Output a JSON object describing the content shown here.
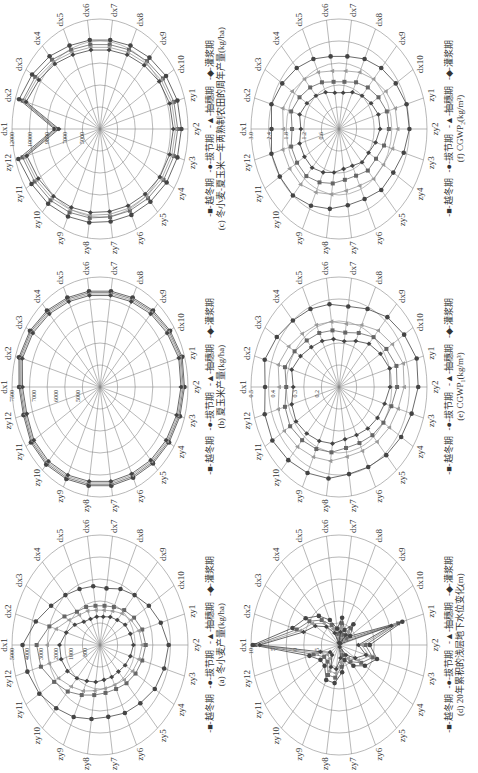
{
  "figure": {
    "axes": [
      "dx1",
      "dx2",
      "dx3",
      "dx4",
      "dx5",
      "dx6",
      "dx7",
      "dx8",
      "dx9",
      "dx10",
      "zy1",
      "zy2",
      "zy3",
      "zy4",
      "zy5",
      "zy6",
      "zy7",
      "zy8",
      "zy9",
      "zy10",
      "zy11",
      "zy12"
    ],
    "legend": [
      {
        "symbol": "■",
        "label": "越冬期"
      },
      {
        "symbol": "●",
        "label": "拔节期"
      },
      {
        "symbol": "▲",
        "label": "抽穗期"
      },
      {
        "symbol": "◆",
        "label": "灌浆期"
      }
    ],
    "colors": {
      "grid": "#888888",
      "series_dark": "#444444",
      "series_mid": "#666666",
      "series_light": "#999999",
      "text": "#333333"
    }
  },
  "chart_data": [
    {
      "id": "a",
      "type": "radar",
      "title": "(a) 冬小麦产量(kg/ha)",
      "ticks": [
        "500",
        "1000",
        "2000",
        "3000",
        "4000",
        "5000"
      ],
      "rmax": 5000,
      "series": [
        {
          "name": "越冬期",
          "values": [
            3600,
            3000,
            2400,
            2000,
            1900,
            1800,
            1800,
            1900,
            2100,
            2300,
            2500,
            2600,
            2500,
            2400,
            2300,
            2200,
            2200,
            2300,
            2500,
            2800,
            3100,
            3500
          ]
        },
        {
          "name": "拔节期",
          "values": [
            4400,
            3800,
            3300,
            3000,
            2800,
            2700,
            2600,
            2800,
            3000,
            3300,
            3600,
            3900,
            3800,
            3700,
            3500,
            3400,
            3300,
            3400,
            3600,
            3800,
            4100,
            4300
          ]
        },
        {
          "name": "抽穗期",
          "values": [
            3000,
            2600,
            2100,
            1800,
            1700,
            1600,
            1600,
            1700,
            1900,
            2100,
            2300,
            2400,
            2300,
            2200,
            2100,
            2000,
            2000,
            2100,
            2300,
            2500,
            2800,
            3000
          ]
        },
        {
          "name": "灌浆期",
          "values": [
            2300,
            2000,
            1700,
            1400,
            1300,
            1300,
            1300,
            1400,
            1500,
            1700,
            1800,
            1900,
            1800,
            1700,
            1600,
            1600,
            1600,
            1700,
            1800,
            2000,
            2200,
            2300
          ]
        }
      ]
    },
    {
      "id": "b",
      "type": "radar",
      "title": "(b) 夏玉米产量(kg/ha)",
      "ticks": [
        "5000",
        "6000",
        "7000",
        "7500"
      ],
      "rmax": 7500,
      "series": [
        {
          "name": "越冬期",
          "values": [
            6800,
            7100,
            7000,
            6800,
            6600,
            6500,
            6500,
            6600,
            6800,
            7000,
            7200,
            7100,
            7000,
            6900,
            6800,
            6700,
            6700,
            6700,
            6800,
            6900,
            6900,
            6700
          ]
        },
        {
          "name": "拔节期",
          "values": [
            6900,
            7200,
            7100,
            6900,
            6700,
            6600,
            6600,
            6700,
            6900,
            7100,
            7300,
            7200,
            7100,
            7000,
            6900,
            6800,
            6800,
            6800,
            6900,
            7000,
            7000,
            6800
          ]
        },
        {
          "name": "抽穗期",
          "values": [
            6700,
            7000,
            6900,
            6700,
            6500,
            6400,
            6400,
            6500,
            6700,
            6900,
            7100,
            7000,
            6900,
            6800,
            6700,
            6600,
            6600,
            6600,
            6700,
            6800,
            6800,
            6600
          ]
        },
        {
          "name": "灌浆期",
          "values": [
            6600,
            6900,
            6800,
            6600,
            6400,
            6300,
            6300,
            6400,
            6600,
            6800,
            7000,
            6900,
            6800,
            6700,
            6600,
            6500,
            6500,
            6500,
            6600,
            6700,
            6700,
            6500
          ]
        }
      ]
    },
    {
      "id": "c",
      "type": "radar",
      "title": "(c) 冬小麦-夏玉米一年两熟制农田的周年产量(kg/ha)",
      "ticks": [
        "5000",
        "7000",
        "9000",
        "10000",
        "12000"
      ],
      "rmax": 12000,
      "series": [
        {
          "name": "越冬期",
          "values": [
            6000,
            11000,
            10500,
            10000,
            9500,
            9300,
            9300,
            9500,
            9800,
            10200,
            10500,
            10600,
            10500,
            10300,
            10000,
            9800,
            9700,
            9800,
            10000,
            10300,
            10600,
            11000
          ]
        },
        {
          "name": "拔节期",
          "values": [
            6200,
            11500,
            11000,
            10500,
            10000,
            9800,
            9800,
            10000,
            10300,
            10700,
            11000,
            11100,
            11000,
            10800,
            10500,
            10300,
            10200,
            10300,
            10500,
            10800,
            11100,
            11600
          ]
        },
        {
          "name": "抽穗期",
          "values": [
            5800,
            10800,
            10200,
            9700,
            9200,
            9000,
            9000,
            9200,
            9500,
            9900,
            10200,
            10300,
            10200,
            10000,
            9700,
            9500,
            9400,
            9500,
            9700,
            10000,
            10300,
            10700
          ]
        },
        {
          "name": "灌浆期",
          "values": [
            5600,
            10500,
            9900,
            9400,
            8900,
            8700,
            8700,
            8900,
            9200,
            9600,
            9900,
            10000,
            9900,
            9700,
            9400,
            9200,
            9100,
            9200,
            9400,
            9700,
            10000,
            10400
          ]
        }
      ]
    },
    {
      "id": "d",
      "type": "radar",
      "title": "(d) 20年累积的浅层地下水位变化(m)",
      "ticks": [
        "-5",
        "0",
        "5",
        "10"
      ],
      "rmax": 10,
      "series": [
        {
          "name": "越冬期",
          "values": [
            9.5,
            5,
            4,
            3,
            2,
            1,
            2,
            1,
            2,
            1,
            7,
            3,
            4,
            3,
            2,
            1,
            2,
            3,
            3,
            2,
            2,
            3
          ]
        },
        {
          "name": "拔节期",
          "values": [
            9.8,
            5.5,
            4.5,
            3.5,
            2.5,
            1.5,
            2.5,
            1.5,
            2.5,
            1.5,
            7.5,
            3.5,
            4.5,
            3.5,
            2.5,
            1.5,
            2.5,
            3.5,
            3.5,
            2.5,
            2.5,
            3.5
          ]
        },
        {
          "name": "抽穗期",
          "values": [
            9.2,
            4.6,
            3.6,
            2.6,
            1.6,
            0.6,
            1.6,
            0.6,
            1.6,
            0.6,
            6.6,
            2.6,
            3.6,
            2.6,
            1.6,
            0.6,
            1.6,
            2.6,
            2.6,
            1.6,
            1.6,
            2.6
          ]
        },
        {
          "name": "灌浆期",
          "values": [
            9.0,
            4.2,
            3.2,
            2.2,
            1.2,
            0.2,
            1.2,
            0.2,
            1.2,
            0.2,
            6.2,
            2.2,
            3.2,
            2.2,
            1.2,
            0.2,
            1.2,
            2.2,
            2.2,
            1.2,
            1.2,
            2.2
          ]
        }
      ]
    },
    {
      "id": "e",
      "type": "radar",
      "title": "(e) CGWP₁(kg/m³)",
      "ticks": [
        "0.2",
        "0.3",
        "0.4",
        "0.5"
      ],
      "rmax": 0.5,
      "series": [
        {
          "name": "越冬期",
          "values": [
            0.3,
            0.32,
            0.3,
            0.28,
            0.27,
            0.26,
            0.25,
            0.27,
            0.3,
            0.32,
            0.34,
            0.33,
            0.31,
            0.3,
            0.29,
            0.28,
            0.28,
            0.3,
            0.31,
            0.32,
            0.33,
            0.32
          ]
        },
        {
          "name": "拔节期",
          "values": [
            0.42,
            0.44,
            0.42,
            0.4,
            0.39,
            0.38,
            0.37,
            0.39,
            0.42,
            0.44,
            0.46,
            0.45,
            0.43,
            0.42,
            0.41,
            0.4,
            0.4,
            0.42,
            0.43,
            0.44,
            0.45,
            0.44
          ]
        },
        {
          "name": "抽穗期",
          "values": [
            0.34,
            0.36,
            0.34,
            0.32,
            0.31,
            0.3,
            0.29,
            0.31,
            0.34,
            0.36,
            0.38,
            0.37,
            0.35,
            0.34,
            0.33,
            0.32,
            0.32,
            0.34,
            0.35,
            0.36,
            0.37,
            0.36
          ]
        },
        {
          "name": "灌浆期",
          "values": [
            0.26,
            0.28,
            0.26,
            0.24,
            0.23,
            0.22,
            0.21,
            0.23,
            0.26,
            0.28,
            0.3,
            0.29,
            0.27,
            0.26,
            0.25,
            0.24,
            0.24,
            0.26,
            0.27,
            0.28,
            0.29,
            0.28
          ]
        }
      ]
    },
    {
      "id": "f",
      "type": "radar",
      "title": "(f) CGWP₂(kg/m³)",
      "ticks": [
        "0.6",
        "1.2",
        "1.8",
        "2.4",
        "3.0"
      ],
      "rmax": 3.0,
      "series": [
        {
          "name": "越冬期",
          "values": [
            1.6,
            1.7,
            1.6,
            1.5,
            1.4,
            1.3,
            1.3,
            1.4,
            1.5,
            1.6,
            1.7,
            1.7,
            1.6,
            1.5,
            1.5,
            1.4,
            1.4,
            1.5,
            1.6,
            1.7,
            1.7,
            1.7
          ]
        },
        {
          "name": "拔节期",
          "values": [
            2.3,
            2.4,
            2.3,
            2.2,
            2.1,
            2.0,
            2.0,
            2.1,
            2.2,
            2.3,
            2.4,
            2.4,
            2.3,
            2.2,
            2.2,
            2.1,
            2.1,
            2.2,
            2.3,
            2.4,
            2.4,
            2.4
          ]
        },
        {
          "name": "抽穗期",
          "values": [
            1.9,
            2.0,
            1.9,
            1.8,
            1.7,
            1.6,
            1.6,
            1.7,
            1.8,
            1.9,
            2.0,
            2.0,
            1.9,
            1.8,
            1.8,
            1.7,
            1.7,
            1.8,
            1.9,
            2.0,
            2.0,
            2.0
          ]
        },
        {
          "name": "灌浆期",
          "values": [
            1.3,
            1.4,
            1.3,
            1.2,
            1.1,
            1.0,
            1.0,
            1.1,
            1.2,
            1.3,
            1.4,
            1.4,
            1.3,
            1.2,
            1.2,
            1.1,
            1.1,
            1.2,
            1.3,
            1.4,
            1.4,
            1.4
          ]
        }
      ]
    }
  ]
}
